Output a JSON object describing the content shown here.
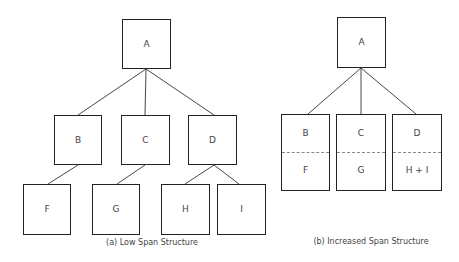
{
  "diagrams": {
    "low_span": {
      "caption": "(a)  Low Span Structure",
      "nodes": {
        "A": "A",
        "B": "B",
        "C": "C",
        "D": "D",
        "F": "F",
        "G": "G",
        "H": "H",
        "I": "I"
      },
      "edges": [
        [
          "A",
          "B"
        ],
        [
          "A",
          "C"
        ],
        [
          "A",
          "D"
        ],
        [
          "B",
          "F"
        ],
        [
          "C",
          "G"
        ],
        [
          "D",
          "H"
        ],
        [
          "D",
          "I"
        ]
      ]
    },
    "increased_span": {
      "caption": "(b)  Increased Span Structure",
      "nodes": {
        "A": "A",
        "B_top": "B",
        "B_bottom": "F",
        "C_top": "C",
        "C_bottom": "G",
        "D_top": "D",
        "D_bottom": "H + I"
      },
      "edges": [
        [
          "A",
          "B/F"
        ],
        [
          "A",
          "C/G"
        ],
        [
          "A",
          "D/H+I"
        ]
      ]
    }
  }
}
